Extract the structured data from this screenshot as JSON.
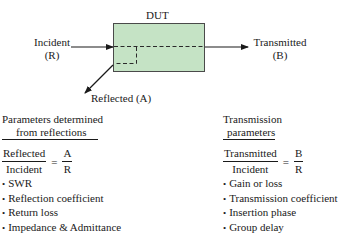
{
  "diagram": {
    "dut_label": "DUT",
    "box_color": "#c5e3c5",
    "box_border": "#4a4a4a",
    "incident": {
      "line1": "Incident",
      "line2": "(R)"
    },
    "transmitted": {
      "line1": "Transmitted",
      "line2": "(B)"
    },
    "reflected": "Reflected (A)"
  },
  "reflection": {
    "heading_line1": "Parameters determined",
    "heading_line2": "from reflections",
    "ratio": {
      "numerator": "Reflected",
      "denominator": "Incident",
      "equals": "=",
      "num2": "A",
      "den2": "R"
    },
    "items": [
      "SWR",
      "Reflection coefficient",
      "Return loss",
      "Impedance & Admittance"
    ]
  },
  "transmission": {
    "heading_line1": "Transmission",
    "heading_line2": "parameters",
    "ratio": {
      "numerator": "Transmitted",
      "denominator": "Incident",
      "equals": "=",
      "num2": "B",
      "den2": "R"
    },
    "items": [
      "Gain or loss",
      "Transmission coefficient",
      "Insertion phase",
      "Group delay"
    ]
  }
}
